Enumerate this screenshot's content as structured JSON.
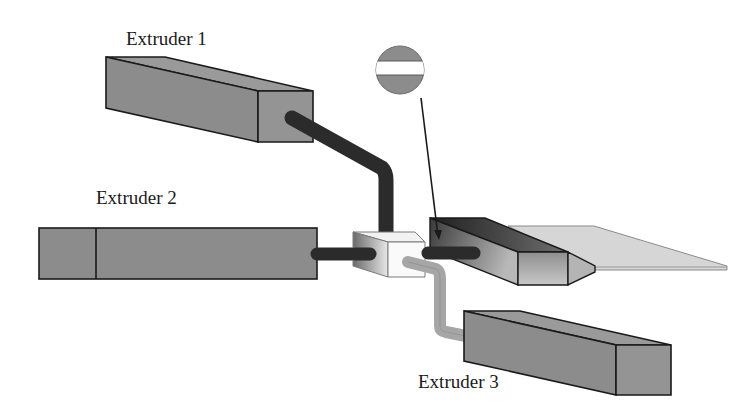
{
  "diagram": {
    "type": "coextrusion-schematic",
    "labels": {
      "extruder_1": "Extruder 1",
      "extruder_2": "Extruder 2",
      "extruder_3": "Extruder 3"
    },
    "components": [
      {
        "id": "extruder-1",
        "label": "Extruder 1",
        "feed": "dark-pipe"
      },
      {
        "id": "extruder-2",
        "label": "Extruder 2",
        "feed": "dark-pipe"
      },
      {
        "id": "extruder-3",
        "label": "Extruder 3",
        "feed": "light-pipe"
      },
      {
        "id": "feedblock",
        "label": ""
      },
      {
        "id": "die",
        "label": ""
      },
      {
        "id": "sheet",
        "label": ""
      },
      {
        "id": "layer-cross-section",
        "label": "",
        "description": "circle with horizontal white band callout pointing at die"
      }
    ],
    "colors": {
      "extruder_fill": "#8c8c8c",
      "extruder_top": "#9a9a9a",
      "dark_pipe": "#2b2b2b",
      "light_pipe": "#a6a6a6",
      "sheet": "#d4d4d4",
      "outline": "#1a1a1a"
    }
  }
}
